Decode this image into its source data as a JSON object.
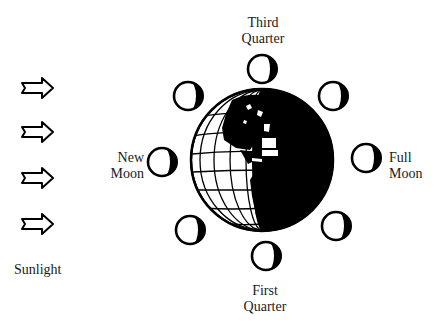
{
  "diagram": {
    "sunlight_label": "Sunlight",
    "arrows": [
      {
        "icon": "arrow-right-icon",
        "x": 22,
        "y": 87
      },
      {
        "icon": "arrow-right-icon",
        "x": 22,
        "y": 131
      },
      {
        "icon": "arrow-right-icon",
        "x": 22,
        "y": 177
      },
      {
        "icon": "arrow-right-icon",
        "x": 22,
        "y": 224
      }
    ],
    "earth": {
      "icon": "earth-globe-icon",
      "cx": 262,
      "cy": 160,
      "r": 72
    },
    "labels": {
      "third_quarter": {
        "line1": "Third",
        "line2": "Quarter"
      },
      "new_moon": {
        "line1": "New",
        "line2": "Moon"
      },
      "full_moon": {
        "line1": "Full",
        "line2": "Moon"
      },
      "first_quarter": {
        "line1": "First",
        "line2": "Quarter"
      }
    },
    "moons": [
      {
        "name": "third-quarter",
        "cx": 262,
        "cy": 69
      },
      {
        "name": "waning-gibbous",
        "cx": 333,
        "cy": 96
      },
      {
        "name": "full-moon",
        "cx": 366,
        "cy": 158
      },
      {
        "name": "waxing-gibbous",
        "cx": 336,
        "cy": 226
      },
      {
        "name": "first-quarter",
        "cx": 266,
        "cy": 256
      },
      {
        "name": "waxing-crescent",
        "cx": 190,
        "cy": 230
      },
      {
        "name": "new-moon",
        "cx": 162,
        "cy": 162
      },
      {
        "name": "waning-crescent",
        "cx": 188,
        "cy": 96
      }
    ],
    "colors": {
      "ink": "#000000",
      "paper": "#ffffff"
    }
  }
}
